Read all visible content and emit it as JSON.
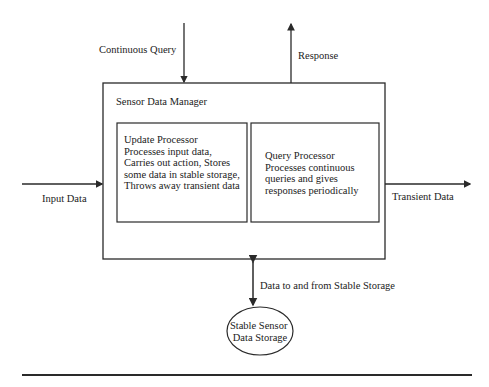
{
  "diagram": {
    "colors": {
      "stroke": "#2a2a2a",
      "text": "#222222",
      "background": "#ffffff"
    },
    "external_inputs": {
      "continuous_query": "Continuous Query",
      "response": "Response",
      "input_data": "Input Data",
      "transient_data": "Transient Data",
      "stable_storage_link": "Data to and from Stable Storage"
    },
    "manager": {
      "title": "Sensor Data Manager",
      "update_processor": {
        "lines": [
          "Update Processor",
          "Processes input data,",
          "Carries out action, Stores",
          "some data in stable storage,",
          "Throws away transient data"
        ]
      },
      "query_processor": {
        "lines": [
          "Query Processor",
          "Processes continuous",
          "queries and gives",
          "responses periodically"
        ]
      }
    },
    "storage": {
      "lines": [
        "Stable Sensor",
        "Data Storage"
      ]
    }
  }
}
